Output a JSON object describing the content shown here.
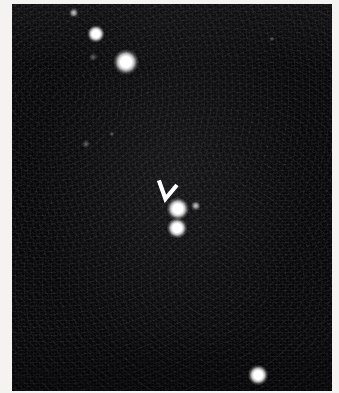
{
  "image": {
    "kind": "astronomical-star-field-photograph",
    "caption": "Night sky photographic plate with chevron marker indicating target object",
    "width": 339,
    "height": 393,
    "frame": {
      "x": 12,
      "y": 4,
      "width": 320,
      "height": 389
    },
    "background_color": "#07070a",
    "margin_color": "#f4f3f1",
    "star_color": "#ffffff"
  },
  "marker": {
    "name": "chevron-arrowhead-marker",
    "shape": "V",
    "color": "#ffffff",
    "x": 167,
    "y": 192,
    "width": 22,
    "height": 20,
    "rotation_deg": 10,
    "points_to": "target-star"
  },
  "stars": [
    {
      "label": "star-top-small",
      "x": 74,
      "y": 13,
      "r": 4,
      "class": "faint"
    },
    {
      "label": "star-upper-left",
      "x": 96,
      "y": 34,
      "r": 7,
      "class": ""
    },
    {
      "label": "star-upper-left-faint",
      "x": 93,
      "y": 57,
      "r": 3,
      "class": "vfaint"
    },
    {
      "label": "star-upper-bright",
      "x": 126,
      "y": 62,
      "r": 10,
      "class": ""
    },
    {
      "label": "star-mid-smudge-a",
      "x": 86,
      "y": 144,
      "r": 3,
      "class": "vfaint"
    },
    {
      "label": "star-mid-smudge-b",
      "x": 112,
      "y": 134,
      "r": 2,
      "class": "vfaint"
    },
    {
      "label": "target-star",
      "x": 178,
      "y": 209,
      "r": 9,
      "class": ""
    },
    {
      "label": "star-companion-right",
      "x": 196,
      "y": 206,
      "r": 4,
      "class": "faint"
    },
    {
      "label": "star-lower-pair",
      "x": 177,
      "y": 228,
      "r": 8,
      "class": ""
    },
    {
      "label": "star-bottom-right",
      "x": 258,
      "y": 375,
      "r": 8,
      "class": ""
    },
    {
      "label": "star-right-upper-faint",
      "x": 272,
      "y": 39,
      "r": 2,
      "class": "vfaint"
    }
  ],
  "accessibility": {
    "alt_text": "Dark grainy astronomical photograph of a star field. A white V-shaped chevron marker points down-right at a bright star near the image center, which has a close bright companion below it and a smaller faint star to its right. Brighter stars appear in the upper left and at the lower right."
  }
}
